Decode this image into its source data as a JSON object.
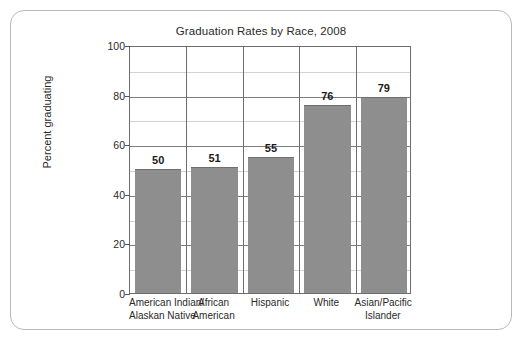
{
  "chart_data": {
    "type": "bar",
    "title": "Graduation Rates by Race, 2008",
    "xlabel": "",
    "ylabel": "Percent graduating",
    "categories": [
      "American Indian/ Alaskan Native",
      "African American",
      "Hispanic",
      "White",
      "Asian/Pacific Islander"
    ],
    "category_lines": [
      [
        "American Indian/",
        "Alaskan Native"
      ],
      [
        "African",
        "American"
      ],
      [
        "Hispanic"
      ],
      [
        "White"
      ],
      [
        "Asian/Pacific",
        "Islander"
      ]
    ],
    "values": [
      50,
      51,
      55,
      76,
      79
    ],
    "value_labels": [
      "50",
      "51",
      "55",
      "76",
      "79"
    ],
    "ylim": [
      0,
      100
    ],
    "ytick_values": [
      0,
      20,
      40,
      60,
      80,
      100
    ],
    "ytick_labels": [
      "0",
      "20",
      "40",
      "60",
      "80",
      "100"
    ],
    "minor_gridline_values": [
      10,
      30,
      50,
      70,
      90
    ],
    "grid": "major horizontal gridlines every 20, minor horizontal gridlines every 10, vertical separators between categories",
    "legend": "none",
    "bar_color": "#8e8e8e",
    "gridline_color_major": "#7d7d7d",
    "gridline_color_minor": "#d2d2d2",
    "axis_color": "#6d6d6d",
    "text_color": "#2a2a2a",
    "background_color": "#ffffff",
    "card_border_color": "#b9b9b9"
  }
}
